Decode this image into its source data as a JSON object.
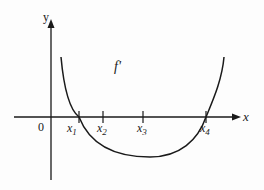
{
  "diagram": {
    "title": "",
    "curve_label": "f'",
    "axes": {
      "x_label": "x",
      "y_label": "y",
      "origin_label": "0"
    },
    "ticks": [
      {
        "label": "x",
        "sub": "1",
        "role": "root"
      },
      {
        "label": "x",
        "sub": "2",
        "role": "point"
      },
      {
        "label": "x",
        "sub": "3",
        "role": "point"
      },
      {
        "label": "x",
        "sub": "4",
        "role": "root"
      }
    ],
    "colors": {
      "ink": "#1a1a1a",
      "background": "#fdfdfd"
    }
  }
}
